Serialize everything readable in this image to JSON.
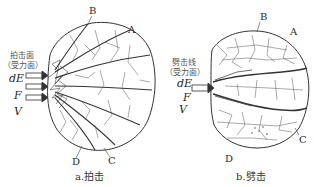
{
  "figure_a": {
    "caption": "a.拍击",
    "surface_label_line1": "拍击面",
    "surface_label_line2": "（受力面）",
    "vars": [
      "dE",
      "F",
      "V"
    ],
    "points": [
      "A",
      "B",
      "C",
      "D"
    ],
    "arrow_count": 3
  },
  "figure_b": {
    "caption": "b.劈击",
    "surface_label_line1": "劈击线",
    "surface_label_line2": "（受力面）",
    "vars": [
      "dE",
      "F",
      "V"
    ],
    "points": [
      "A",
      "B",
      "C",
      "D"
    ],
    "arrow_count": 1
  },
  "colors": {
    "ink": "#2a2a2a",
    "background": "#ffffff"
  }
}
